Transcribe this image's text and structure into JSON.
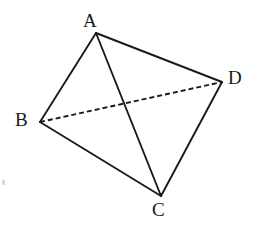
{
  "figure": {
    "type": "geometric-diagram",
    "background_color": "#ffffff",
    "stroke_color": "#1a1a1a",
    "label_color": "#1a1a1a",
    "canvas": {
      "width": 260,
      "height": 244
    },
    "vertices": [
      {
        "id": "A",
        "label": "A",
        "x": 96,
        "y": 33,
        "label_x": 83,
        "label_y": 11
      },
      {
        "id": "B",
        "label": "B",
        "x": 40,
        "y": 122,
        "label_x": 15,
        "label_y": 110
      },
      {
        "id": "C",
        "label": "C",
        "x": 161,
        "y": 196,
        "label_x": 152,
        "label_y": 200
      },
      {
        "id": "D",
        "label": "D",
        "x": 222,
        "y": 82,
        "label_x": 228,
        "label_y": 68
      }
    ],
    "edges": [
      {
        "id": "AB",
        "from": "A",
        "to": "B",
        "style": "solid",
        "x1": 96,
        "y1": 33,
        "x2": 40,
        "y2": 122,
        "width": 1.9
      },
      {
        "id": "AC",
        "from": "A",
        "to": "C",
        "style": "solid",
        "x1": 96,
        "y1": 33,
        "x2": 161,
        "y2": 196,
        "width": 1.9
      },
      {
        "id": "AD",
        "from": "A",
        "to": "D",
        "style": "solid",
        "x1": 96,
        "y1": 33,
        "x2": 222,
        "y2": 82,
        "width": 1.9
      },
      {
        "id": "BC",
        "from": "B",
        "to": "C",
        "style": "solid",
        "x1": 40,
        "y1": 122,
        "x2": 161,
        "y2": 196,
        "width": 1.9
      },
      {
        "id": "CD",
        "from": "C",
        "to": "D",
        "style": "solid",
        "x1": 161,
        "y1": 196,
        "x2": 222,
        "y2": 82,
        "width": 1.9
      },
      {
        "id": "BD",
        "from": "B",
        "to": "D",
        "style": "dashed",
        "x1": 40,
        "y1": 122,
        "x2": 222,
        "y2": 82,
        "width": 1.9,
        "dash": "5 3"
      }
    ],
    "artifacts": [
      {
        "id": "speck-left",
        "x": 2,
        "y": 180,
        "width": 3,
        "height": 5,
        "color": "#d8d8d8"
      }
    ]
  }
}
